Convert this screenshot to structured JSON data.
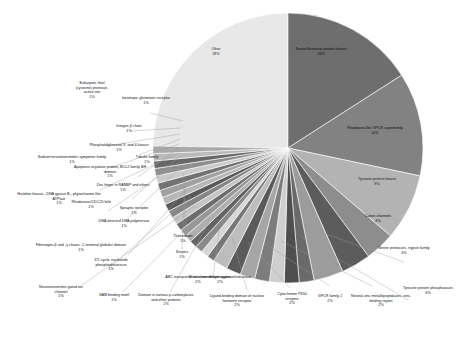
{
  "chart_data": {
    "type": "pie",
    "title": "",
    "subtitle": "",
    "xlabel": "",
    "ylabel": "",
    "legend_position": "none",
    "grid": false,
    "value_unit": "%",
    "categories": [
      "Other",
      "Serine/threonine protein kinase",
      "Rhodopsin-like GPCR superfamily",
      "Tyrosine protein kinase",
      "Cation channels",
      "Serine proteases, trypsin family",
      "Tyrosine protein phosphatases",
      "Neutral zinc metallopeptidases, zinc-binding region",
      "GPCR family 2",
      "Cytochrome P450 enzyme",
      "Ligand-binding domain of nuclear hormone receptor",
      "Short-chain dehydrogenase/reductase",
      "ABC transporter, transmembrane region",
      "Domain in various p-carboxylases and other proteins",
      "SAM binding motif",
      "Neurotransmitter-gated ion channel",
      "3'5'-cyclic nucleotide phosphodiesterase",
      "Fibrinogen beta and gamma chains, C-terminal globular domain",
      "Serpins",
      "Thioredoxin",
      "DNA-directed DNA polymerase",
      "Synaptic receptor",
      "Rhodanese/CDC25 fold",
      "Histidine kinase-, DNA gyrase B-, phytochrome-like ATPase",
      "Zinc finger, RANBP and others",
      "Apoptosis regulator protein, BCL2 family BH domain",
      "Tubulin family",
      "Sodium:neurotransmitter symporter family",
      "Phosphatidylinositol 3- and 4-kinase",
      "Integrin beta chain",
      "Ionotropic glutamate receptor",
      "Eukaryotic thiol (cysteine) protease, active site"
    ],
    "values": [
      28,
      18,
      14,
      9,
      4,
      4,
      4,
      2,
      2,
      2,
      2,
      2,
      2,
      2,
      1,
      1,
      1,
      1,
      1,
      1,
      1,
      1,
      1,
      1,
      1,
      1,
      1,
      1,
      1,
      1,
      1,
      1
    ],
    "labels": [
      "Other",
      "Serine/threonine protein kinase",
      "Rhodopsin-like GPCR superfamily",
      "Tyrosine protein kinase",
      "Cation channels",
      "Serine proteases, trypsin family",
      "Tyrosine protein phosphatases",
      "Neutral zinc metallopeptidases, zinc-binding region",
      "GPCR family 2",
      "Cytochrome P450 enzyme",
      "Ligand-binding domain of nuclear hormone receptor",
      "Short-chain dehydrogenase/reductase",
      "ABC transporter, transmembrane region",
      "Domain in various p-carboxylases and other proteins",
      "SAM binding motif",
      "Neurotransmitter-gated ion channel",
      "3'5'-cyclic nucleotide phosphodiesterase",
      "Fibrinogen beta and gamma chains, C-terminal globular domain",
      "Serpins",
      "Thioredoxin",
      "DNA-directed DNA polymerase",
      "Synaptic receptor",
      "Rhodanese/CDC25 fold",
      "Histidine kinase-, DNA gyrase B-, phytochrome-like ATPase",
      "Zinc finger, RANBP and others",
      "Apoptosis regulator protein, BCL2 family BH domain",
      "Tubulin family",
      "Sodium:neurotransmitter symporter family",
      "Phosphatidylinositol 3- and 4-kinase",
      "Integrin beta chain",
      "Ionotropic glutamate receptor",
      "Eukaryotic thiol (cysteine) protease, active site"
    ],
    "percent_labels": [
      "28%",
      "18%",
      "14%",
      "9%",
      "4%",
      "4%",
      "4%",
      "2%",
      "2%",
      "2%",
      "2%",
      "2%",
      "2%",
      "2%",
      "1%",
      "1%",
      "1%",
      "1%",
      "1%",
      "1%",
      "1%",
      "1%",
      "1%",
      "1%",
      "1%",
      "1%",
      "1%",
      "1%",
      "1%",
      "1%",
      "1%",
      "1%"
    ],
    "colors": [
      "#e8e8e8",
      "#6e6e6e",
      "#828282",
      "#b3b3b3",
      "#8d8d8d",
      "#5c5c5c",
      "#9c9c9c",
      "#6a6a6a",
      "#4f4f4f",
      "#cfcfcf",
      "#7d7d7d",
      "#a6a6a6",
      "#5a5a5a",
      "#bdbdbd",
      "#777777",
      "#d6d6d6",
      "#8a8a8a",
      "#636363",
      "#aeaeae",
      "#979797",
      "#6d6d6d",
      "#c4c4c4",
      "#858585",
      "#595959",
      "#b7b7b7",
      "#a0a0a0",
      "#727272",
      "#cacaca",
      "#8f8f8f",
      "#676767",
      "#bababa",
      "#a9a9a9"
    ]
  },
  "labels_placement": {
    "other": {
      "name": "Other",
      "pct": "28%"
    },
    "ser_thr": {
      "name": "Serine/threonine protein kinase",
      "pct": "18%"
    },
    "gpcr_rhodopsin": {
      "name": "Rhodopsin-like GPCR superfamily",
      "pct": "14%"
    },
    "tyr_kinase": {
      "name": "Tyrosine protein kinase",
      "pct": "9%"
    },
    "cation": {
      "name": "Cation channels",
      "pct": "4%"
    },
    "trypsin": {
      "name": "Serine proteases, trypsin family",
      "pct": "4%"
    },
    "tyr_phos": {
      "name": "Tyrosine protein phosphatases",
      "pct": "4%"
    },
    "zincmet": {
      "name": "Neutral zinc metallopeptidases, zinc-binding region",
      "pct": "2%"
    },
    "gpcr2": {
      "name": "GPCR family 2",
      "pct": "2%"
    },
    "p450": {
      "name": "Cytochrome P450 enzyme",
      "pct": "2%"
    },
    "nhr": {
      "name": "Ligand-binding domain of nuclear hormone receptor",
      "pct": "2%"
    },
    "sdr": {
      "name": "Short-chain dehydrogenase/reductase",
      "pct": "2%"
    },
    "abc": {
      "name": "ABC transporter, transmembrane region",
      "pct": "2%"
    },
    "pcarbox": {
      "name": "Domain in various p-carboxylases and other proteins",
      "pct": "2%"
    },
    "sam": {
      "name": "SAM binding motif",
      "pct": "1%"
    },
    "ntgated": {
      "name": "Neurotransmitter-gated ion channel",
      "pct": "1%"
    },
    "pde": {
      "name": "3'5'-cyclic nucleotide phosphodiesterase",
      "pct": "1%"
    },
    "fibrinogen": {
      "name": "Fibrinogen-β and -γ chains, C-terminal globular domain",
      "pct": "1%"
    },
    "serpins": {
      "name": "Serpins",
      "pct": "1%"
    },
    "thioredoxin": {
      "name": "Thioredoxin",
      "pct": "1%"
    },
    "dnapol": {
      "name": "DNA-directed DNA polymerase",
      "pct": "1%"
    },
    "synaptic": {
      "name": "Synaptic receptor",
      "pct": "1%"
    },
    "rhodanese": {
      "name": "Rhodanese/CDC25 fold",
      "pct": "1%"
    },
    "hiskinase": {
      "name": "Histidine kinase-, DNA gyrase B-, phytochrome-like ATPase",
      "pct": "1%"
    },
    "zincfinger": {
      "name": "Zinc finger in RANBP and others",
      "pct": "1%"
    },
    "bcl2": {
      "name": "Apoptosis regulator protein, BCL2 family BH domain",
      "pct": "1%"
    },
    "tubulin": {
      "name": "Tubulin family",
      "pct": "1%"
    },
    "symporter": {
      "name": "Sodium:neurotransmitter symporter family",
      "pct": "1%"
    },
    "pi34k": {
      "name": "Phosphatidylinositol 3- and 4-kinase",
      "pct": "1%"
    },
    "integrin": {
      "name": "Integrin β chain",
      "pct": "1%"
    },
    "iglur": {
      "name": "Ionotropic glutamate receptor",
      "pct": "1%"
    },
    "cysprot": {
      "name": "Eukaryotic thiol (cysteine) protease, active site",
      "pct": "1%"
    }
  }
}
